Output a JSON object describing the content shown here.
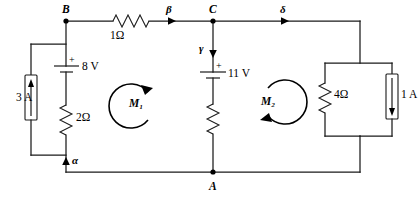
{
  "figure": {
    "type": "circuit-schematic",
    "background_color": "#ffffff",
    "line_color": "#1a1a1a"
  },
  "nodes": [
    {
      "id": "node-a",
      "label": "A",
      "x": 213,
      "y": 172
    },
    {
      "id": "node-b",
      "label": "B",
      "x": 66,
      "y": 21
    },
    {
      "id": "node-c",
      "label": "C",
      "x": 213,
      "y": 21
    }
  ],
  "branch_currents": [
    {
      "id": "alpha",
      "label": "α",
      "direction": "up",
      "x": 66,
      "y": 160
    },
    {
      "id": "beta",
      "label": "β",
      "direction": "right",
      "x": 170,
      "y": 21
    },
    {
      "id": "gamma",
      "label": "γ",
      "direction": "down",
      "x": 213,
      "y": 48
    },
    {
      "id": "delta",
      "label": "δ",
      "direction": "right",
      "x": 283,
      "y": 21
    }
  ],
  "meshes": [
    {
      "id": "mesh-1",
      "label": "M",
      "subscript": "1",
      "text": "M₁",
      "direction": "clockwise"
    },
    {
      "id": "mesh-2",
      "label": "M",
      "subscript": "2",
      "text": "M₂",
      "direction": "clockwise"
    }
  ],
  "components": [
    {
      "id": "current-source-3a",
      "kind": "current-source",
      "value": "3 A",
      "orientation": "vertical",
      "arrow": "up",
      "branch": "left"
    },
    {
      "id": "battery-8v",
      "kind": "voltage-source",
      "value": "8 V",
      "polarity": "+",
      "orientation": "vertical",
      "plus_on": "top",
      "branch": "B-to-alpha"
    },
    {
      "id": "resistor-2ohm",
      "kind": "resistor",
      "value": "2Ω",
      "orientation": "vertical",
      "branch": "B-to-alpha"
    },
    {
      "id": "resistor-1ohm",
      "kind": "resistor",
      "value": "1Ω",
      "orientation": "horizontal",
      "branch": "B-to-C"
    },
    {
      "id": "battery-11v",
      "kind": "voltage-source",
      "value": "11 V",
      "polarity": "+",
      "orientation": "vertical",
      "plus_on": "top",
      "branch": "C-to-A"
    },
    {
      "id": "resistor-unlabeled",
      "kind": "resistor",
      "value": "",
      "orientation": "vertical",
      "branch": "C-to-A"
    },
    {
      "id": "resistor-4ohm",
      "kind": "resistor",
      "value": "4Ω",
      "orientation": "vertical",
      "branch": "right-parallel"
    },
    {
      "id": "current-source-1a",
      "kind": "current-source",
      "value": "1 A",
      "orientation": "vertical",
      "arrow": "down",
      "branch": "right-parallel"
    }
  ],
  "polarity_marks": [
    {
      "id": "plus-8v",
      "symbol": "+"
    },
    {
      "id": "plus-11v",
      "symbol": "+"
    }
  ]
}
